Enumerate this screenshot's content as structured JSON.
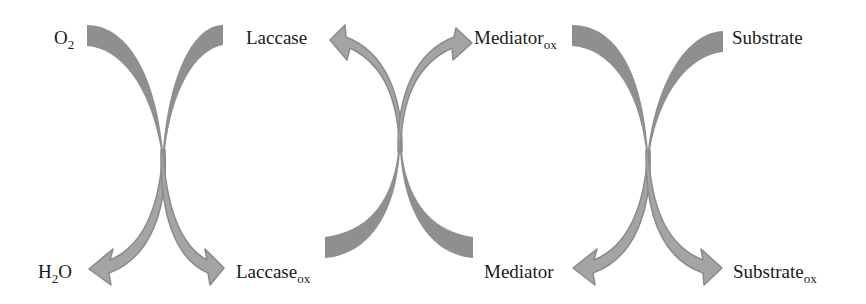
{
  "diagram": {
    "type": "laccase-mediator-system",
    "colors": {
      "arrow_fill": "#8f8f8f",
      "arrowhead_fill": "#a4a4a4",
      "arrow_outline": "#8a8a8a",
      "text": "#1a1a1a",
      "background": "#ffffff"
    },
    "cycles": [
      {
        "name": "laccase-oxygen",
        "top_left": {
          "base": "O",
          "sub": "2"
        },
        "top_right": {
          "base": "Laccase",
          "sub": ""
        },
        "bottom_left": {
          "base": "H",
          "sub": "2",
          "suffix": "O"
        },
        "bottom_right": {
          "base": "Laccase",
          "sub": "ox"
        }
      },
      {
        "name": "laccase-mediator",
        "top_left": {
          "base": "Laccase",
          "sub": ""
        },
        "top_right": {
          "base": "Mediator",
          "sub": "ox"
        },
        "bottom_left": {
          "base": "Laccase",
          "sub": "ox"
        },
        "bottom_right": {
          "base": "Mediator",
          "sub": ""
        }
      },
      {
        "name": "mediator-substrate",
        "top_left": {
          "base": "Mediator",
          "sub": "ox"
        },
        "top_right": {
          "base": "Substrate",
          "sub": ""
        },
        "bottom_left": {
          "base": "Mediator",
          "sub": ""
        },
        "bottom_right": {
          "base": "Substrate",
          "sub": "ox"
        }
      }
    ],
    "labels": {
      "o2": {
        "base": "O",
        "sub": "2"
      },
      "h2o": {
        "base": "H",
        "sub": "2",
        "suffix": "O"
      },
      "laccase": {
        "base": "Laccase"
      },
      "laccase_ox": {
        "base": "Laccase",
        "sub": "ox"
      },
      "mediator_ox": {
        "base": "Mediator",
        "sub": "ox"
      },
      "mediator": {
        "base": "Mediator"
      },
      "substrate": {
        "base": "Substrate"
      },
      "substrate_ox": {
        "base": "Substrate",
        "sub": "ox"
      }
    }
  }
}
